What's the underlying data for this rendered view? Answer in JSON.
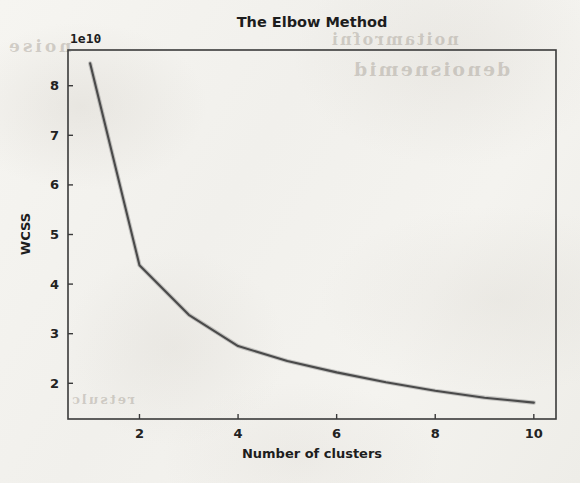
{
  "figure": {
    "background_color": "#f3f2ee",
    "line_color": "#4a4a4a",
    "axis_color": "#3a3a3a",
    "text_color": "#1d1d1d"
  },
  "scan_artifacts": {
    "ghost_text_1": "noise",
    "ghost_text_2": "noitamrofni",
    "ghost_text_3": "denoisnemid",
    "ghost_text_4": "retsulc"
  },
  "chart_data": {
    "type": "line",
    "title": "The Elbow Method",
    "xlabel": "Number of clusters",
    "ylabel": "WCSS",
    "offset_label": "1e10",
    "offset_multiplier": 10000000000,
    "grid": false,
    "legend": null,
    "xlim": [
      0.55,
      10.45
    ],
    "ylim": [
      1.28,
      8.72
    ],
    "xticks": [
      2,
      4,
      6,
      8,
      10
    ],
    "xtick_labels": [
      "2",
      "4",
      "6",
      "8",
      "10"
    ],
    "yticks": [
      2,
      3,
      4,
      5,
      6,
      7,
      8
    ],
    "ytick_labels": [
      "2",
      "3",
      "4",
      "5",
      "6",
      "7",
      "8"
    ],
    "x": [
      1,
      2,
      3,
      4,
      5,
      6,
      7,
      8,
      9,
      10
    ],
    "values_scaled": [
      8.45,
      4.38,
      3.38,
      2.75,
      2.45,
      2.22,
      2.02,
      1.85,
      1.71,
      1.61
    ],
    "values": [
      84500000000,
      43800000000,
      33800000000,
      27500000000,
      24500000000,
      22200000000,
      20200000000,
      18500000000,
      17100000000,
      16100000000
    ],
    "points": [
      {
        "clusters": 1,
        "wcss_scaled": 8.45
      },
      {
        "clusters": 2,
        "wcss_scaled": 4.38
      },
      {
        "clusters": 3,
        "wcss_scaled": 3.38
      },
      {
        "clusters": 4,
        "wcss_scaled": 2.75
      },
      {
        "clusters": 5,
        "wcss_scaled": 2.45
      },
      {
        "clusters": 6,
        "wcss_scaled": 2.22
      },
      {
        "clusters": 7,
        "wcss_scaled": 2.02
      },
      {
        "clusters": 8,
        "wcss_scaled": 1.85
      },
      {
        "clusters": 9,
        "wcss_scaled": 1.71
      },
      {
        "clusters": 10,
        "wcss_scaled": 1.61
      }
    ]
  }
}
